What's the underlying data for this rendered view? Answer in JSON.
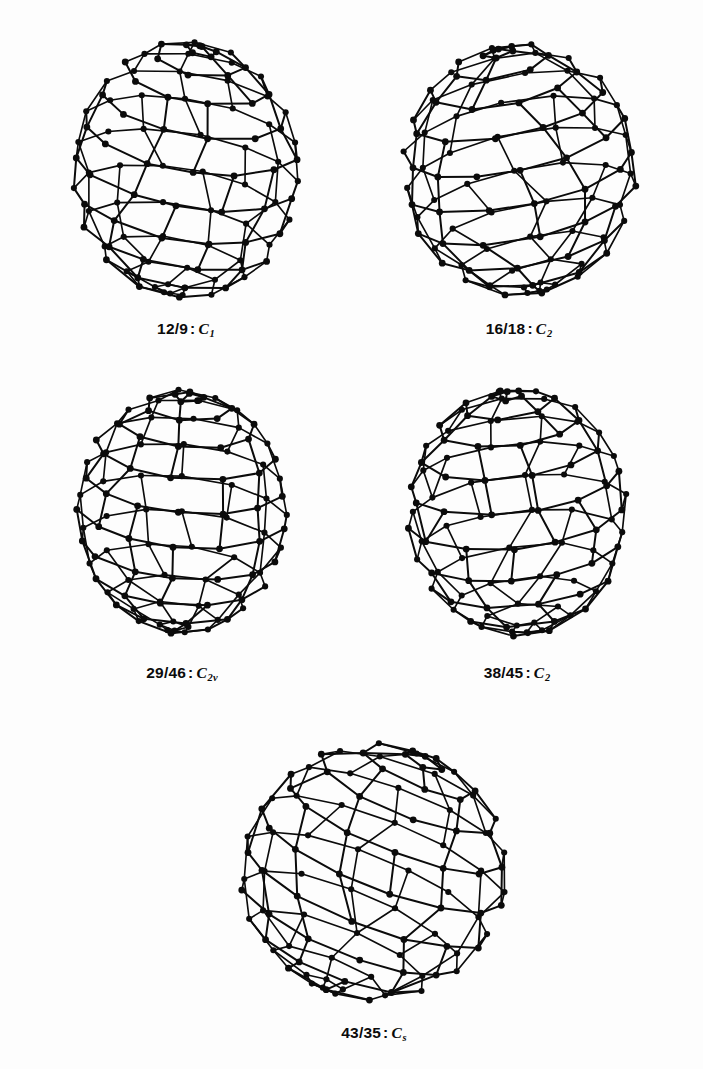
{
  "page": {
    "header_text": "",
    "background": "#ffffff",
    "ink_color": "#0b0b0b",
    "width": 703,
    "height": 1069
  },
  "figure": {
    "type": "molecular-structure-panel",
    "separator": ":",
    "items": [
      {
        "id": "structure-1",
        "isomer": "12/9",
        "symmetry": "C",
        "symmetry_sub": "1",
        "caption": "12/9 : C1",
        "cx": 186,
        "cy": 170,
        "rx": 112,
        "ry": 128,
        "tilt": -8,
        "rings_v": 11,
        "rings_h": 12,
        "seed": 12,
        "label_x": 186,
        "label_y": 320
      },
      {
        "id": "structure-2",
        "isomer": "16/18",
        "symmetry": "C",
        "symmetry_sub": "2",
        "caption": "16/18 : C2",
        "cx": 519,
        "cy": 170,
        "rx": 116,
        "ry": 126,
        "tilt": 10,
        "rings_v": 11,
        "rings_h": 12,
        "seed": 16,
        "label_x": 519,
        "label_y": 320
      },
      {
        "id": "structure-3",
        "isomer": "29/46",
        "symmetry": "C",
        "symmetry_sub": "2v",
        "caption": "29/46 : C2v",
        "cx": 182,
        "cy": 512,
        "rx": 105,
        "ry": 122,
        "tilt": -4,
        "rings_v": 11,
        "rings_h": 12,
        "seed": 29,
        "label_x": 182,
        "label_y": 664
      },
      {
        "id": "structure-4",
        "isomer": "38/45",
        "symmetry": "C",
        "symmetry_sub": "2",
        "caption": "38/45 : C2",
        "cx": 517,
        "cy": 512,
        "rx": 110,
        "ry": 124,
        "tilt": 5,
        "rings_v": 11,
        "rings_h": 12,
        "seed": 38,
        "label_x": 517,
        "label_y": 664
      },
      {
        "id": "structure-5",
        "isomer": "43/35",
        "symmetry": "C",
        "symmetry_sub": "s",
        "caption": "43/35 : Cs",
        "cx": 374,
        "cy": 872,
        "rx": 134,
        "ry": 128,
        "tilt": -22,
        "rings_v": 10,
        "rings_h": 13,
        "seed": 43,
        "label_x": 374,
        "label_y": 1024
      }
    ]
  },
  "style": {
    "vertex_color": "#0b0b0b",
    "bond_color": "#0b0b0b",
    "vertex_radius": 3.4,
    "bond_width": 2.0
  }
}
